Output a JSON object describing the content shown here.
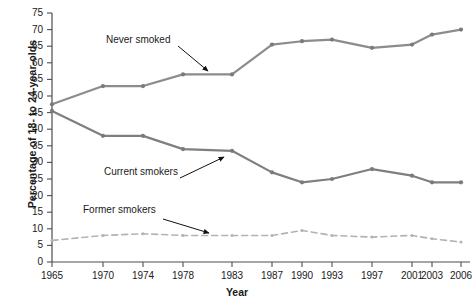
{
  "chart_data": {
    "type": "line",
    "title": "",
    "xlabel": "Year",
    "ylabel": "Percentage of 18- to 24-year-olds",
    "categories": [
      "1965",
      "1970",
      "1974",
      "1978",
      "1983",
      "1987",
      "1990",
      "1993",
      "1997",
      "2001",
      "2003",
      "2006"
    ],
    "x": [
      1965,
      1970,
      1974,
      1978,
      1983,
      1987,
      1990,
      1993,
      1997,
      2001,
      2003,
      2006
    ],
    "ylim": [
      0,
      75
    ],
    "yticks": [
      0,
      5,
      10,
      15,
      20,
      25,
      30,
      35,
      40,
      45,
      50,
      55,
      60,
      65,
      70,
      75
    ],
    "ytick_labels": [
      "0",
      "5",
      "10",
      "15",
      "20",
      "25",
      "30",
      "35",
      "40",
      "45",
      "50",
      "55",
      "60",
      "65",
      "70",
      "75"
    ],
    "grid": false,
    "legend_position": "inline-annotations",
    "series": [
      {
        "name": "Never smoked",
        "style": "solid",
        "color": "#8c8c8c",
        "values": [
          47.5,
          53.0,
          53.0,
          56.5,
          56.5,
          65.5,
          66.5,
          67.0,
          64.5,
          65.5,
          68.5,
          70.0
        ]
      },
      {
        "name": "Current smokers",
        "style": "solid",
        "color": "#7f7f7f",
        "values": [
          45.5,
          38.0,
          38.0,
          34.0,
          33.5,
          27.0,
          24.0,
          25.0,
          28.0,
          26.0,
          24.0,
          24.0
        ]
      },
      {
        "name": "Former smokers",
        "style": "dashed",
        "color": "#b3b3b3",
        "values": [
          6.5,
          8.0,
          8.5,
          8.0,
          8.0,
          8.0,
          9.5,
          8.0,
          7.5,
          8.0,
          7.0,
          6.0
        ]
      }
    ],
    "annotations": [
      {
        "text": "Never smoked",
        "target_series": "Never smoked",
        "target_x": "1983"
      },
      {
        "text": "Current smokers",
        "target_series": "Current smokers",
        "target_x": "1983"
      },
      {
        "text": "Former smokers",
        "target_series": "Former smokers",
        "target_x": "1987"
      }
    ]
  },
  "axes": {
    "y_title": "Percentage of 18- to 24-year-olds",
    "x_title": "Year"
  },
  "annotation_labels": {
    "never": "Never smoked",
    "current": "Current smokers",
    "former": "Former smokers"
  }
}
